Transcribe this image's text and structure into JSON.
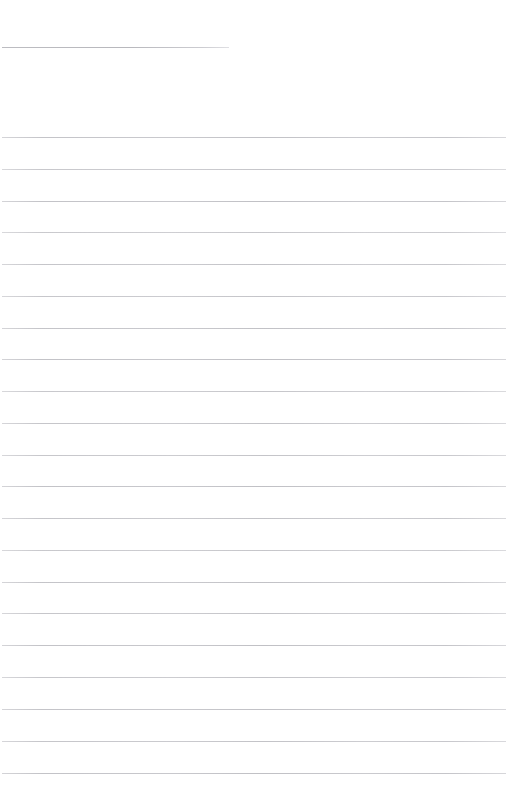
{
  "page": {
    "kind": "scanned-lined-paper",
    "width": 511,
    "height": 805,
    "background_color": "#ffffff",
    "rule_color": "#c5c5c9",
    "rule_thickness": 1,
    "content_text": "",
    "notes_label": ""
  },
  "header_rule": {
    "label": "header-underline",
    "x": 2,
    "y": 47,
    "width": 227,
    "opacity": 0.95
  },
  "body_rules": {
    "label": "ruled-writing-lines",
    "count": 21,
    "first_y": 137,
    "spacing": 31.9,
    "x": 2,
    "width": 504,
    "lines": [
      {
        "y": 137,
        "opacity": 0.88
      },
      {
        "y": 169,
        "opacity": 0.82
      },
      {
        "y": 201,
        "opacity": 0.9
      },
      {
        "y": 232,
        "opacity": 0.8
      },
      {
        "y": 264,
        "opacity": 0.86
      },
      {
        "y": 296,
        "opacity": 0.84
      },
      {
        "y": 328,
        "opacity": 0.88
      },
      {
        "y": 359,
        "opacity": 0.9
      },
      {
        "y": 391,
        "opacity": 0.82
      },
      {
        "y": 423,
        "opacity": 0.86
      },
      {
        "y": 455,
        "opacity": 0.84
      },
      {
        "y": 486,
        "opacity": 0.9
      },
      {
        "y": 518,
        "opacity": 0.86
      },
      {
        "y": 550,
        "opacity": 0.82
      },
      {
        "y": 582,
        "opacity": 0.88
      },
      {
        "y": 613,
        "opacity": 0.85
      },
      {
        "y": 645,
        "opacity": 0.9
      },
      {
        "y": 677,
        "opacity": 0.84
      },
      {
        "y": 709,
        "opacity": 0.88
      },
      {
        "y": 741,
        "opacity": 0.86
      },
      {
        "y": 773,
        "opacity": 0.9
      }
    ]
  }
}
